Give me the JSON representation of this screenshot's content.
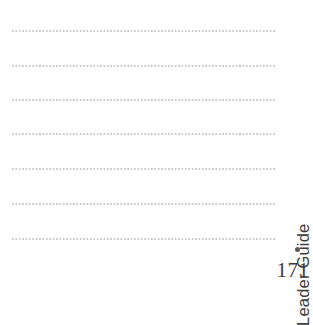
{
  "page": {
    "background_color": "#ffffff",
    "width": 313,
    "height": 283
  },
  "writing_area": {
    "line_color": "#c9c9cf",
    "line_style": "dotted",
    "line_count": 7,
    "left": 12,
    "right": 276,
    "line_positions_y": [
      30,
      65,
      99,
      133,
      168,
      203,
      238
    ]
  },
  "side_rail": {
    "section_label": "Leader Guide",
    "bullet": "●",
    "text_color": "#3c3c3c",
    "bullet_color": "#5a5a5a"
  },
  "footer": {
    "page_number": "171",
    "color": "#3c3c3c"
  }
}
